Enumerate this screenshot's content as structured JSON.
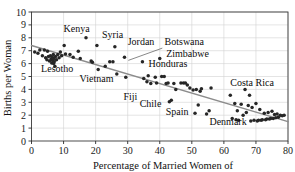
{
  "chart_data": {
    "type": "scatter",
    "title": "",
    "xlabel": "Percentage of Married Women of",
    "ylabel": "Births per Woman",
    "xlim": [
      0,
      80
    ],
    "ylim": [
      0,
      10
    ],
    "xticks": [
      0,
      10,
      20,
      30,
      40,
      50,
      60,
      70,
      80
    ],
    "yticks": [
      0,
      1,
      2,
      3,
      4,
      5,
      6,
      7,
      8,
      9,
      10
    ],
    "grid": true,
    "legend": "none",
    "trendline": {
      "type": "linear",
      "x": [
        0,
        80
      ],
      "y": [
        7.4,
        1.5
      ],
      "color": "#8c8c8c"
    },
    "point_color": "#262626",
    "points": [
      {
        "x": 1.0,
        "y": 6.9
      },
      {
        "x": 2.0,
        "y": 6.8
      },
      {
        "x": 2.6,
        "y": 7.05
      },
      {
        "x": 3.4,
        "y": 6.6
      },
      {
        "x": 4.0,
        "y": 7.05
      },
      {
        "x": 4.4,
        "y": 6.45
      },
      {
        "x": 4.8,
        "y": 6.3
      },
      {
        "x": 5.0,
        "y": 6.95
      },
      {
        "x": 5.3,
        "y": 6.55
      },
      {
        "x": 5.6,
        "y": 6.2
      },
      {
        "x": 5.9,
        "y": 6.6
      },
      {
        "x": 6.1,
        "y": 6.35
      },
      {
        "x": 6.3,
        "y": 6.05
      },
      {
        "x": 6.5,
        "y": 6.5
      },
      {
        "x": 6.6,
        "y": 6.25
      },
      {
        "x": 6.8,
        "y": 6.7
      },
      {
        "x": 6.9,
        "y": 6.0
      },
      {
        "x": 7.0,
        "y": 6.4
      },
      {
        "x": 7.1,
        "y": 6.15
      },
      {
        "x": 7.3,
        "y": 5.8
      },
      {
        "x": 7.5,
        "y": 6.55
      },
      {
        "x": 7.8,
        "y": 6.3
      },
      {
        "x": 8.2,
        "y": 6.7
      },
      {
        "x": 8.6,
        "y": 6.45
      },
      {
        "x": 9.0,
        "y": 6.9
      },
      {
        "x": 9.4,
        "y": 6.6
      },
      {
        "x": 10.2,
        "y": 7.4
      },
      {
        "x": 10.6,
        "y": 6.75
      },
      {
        "x": 12.0,
        "y": 6.7
      },
      {
        "x": 13.0,
        "y": 6.5
      },
      {
        "x": 14.6,
        "y": 6.95
      },
      {
        "x": 15.2,
        "y": 6.4
      },
      {
        "x": 17.0,
        "y": 8.0
      },
      {
        "x": 18.6,
        "y": 6.2
      },
      {
        "x": 19.0,
        "y": 6.1
      },
      {
        "x": 20.4,
        "y": 7.4
      },
      {
        "x": 20.8,
        "y": 5.55
      },
      {
        "x": 23.0,
        "y": 5.8
      },
      {
        "x": 24.4,
        "y": 6.15
      },
      {
        "x": 25.4,
        "y": 6.15
      },
      {
        "x": 26.0,
        "y": 7.3
      },
      {
        "x": 26.6,
        "y": 5.2
      },
      {
        "x": 29.0,
        "y": 6.5
      },
      {
        "x": 29.4,
        "y": 4.95
      },
      {
        "x": 34.6,
        "y": 6.15
      },
      {
        "x": 35.0,
        "y": 4.85
      },
      {
        "x": 36.0,
        "y": 4.6
      },
      {
        "x": 36.4,
        "y": 5.05
      },
      {
        "x": 37.2,
        "y": 4.45
      },
      {
        "x": 38.6,
        "y": 4.95
      },
      {
        "x": 39.0,
        "y": 4.5
      },
      {
        "x": 40.0,
        "y": 6.4
      },
      {
        "x": 40.6,
        "y": 5.0
      },
      {
        "x": 41.4,
        "y": 5.0
      },
      {
        "x": 42.0,
        "y": 4.45
      },
      {
        "x": 42.6,
        "y": 4.5
      },
      {
        "x": 43.0,
        "y": 3.05
      },
      {
        "x": 43.6,
        "y": 3.15
      },
      {
        "x": 44.4,
        "y": 4.45
      },
      {
        "x": 45.0,
        "y": 4.0
      },
      {
        "x": 46.6,
        "y": 4.5
      },
      {
        "x": 47.4,
        "y": 4.5
      },
      {
        "x": 48.0,
        "y": 4.5
      },
      {
        "x": 48.6,
        "y": 4.35
      },
      {
        "x": 49.4,
        "y": 4.1
      },
      {
        "x": 50.4,
        "y": 3.95
      },
      {
        "x": 51.0,
        "y": 2.15
      },
      {
        "x": 51.4,
        "y": 4.0
      },
      {
        "x": 52.0,
        "y": 2.8
      },
      {
        "x": 52.6,
        "y": 3.85
      },
      {
        "x": 53.0,
        "y": 4.05
      },
      {
        "x": 54.6,
        "y": 2.1
      },
      {
        "x": 55.4,
        "y": 2.35
      },
      {
        "x": 56.0,
        "y": 4.1
      },
      {
        "x": 62.0,
        "y": 3.55
      },
      {
        "x": 62.6,
        "y": 1.75
      },
      {
        "x": 63.4,
        "y": 2.9
      },
      {
        "x": 63.8,
        "y": 1.65
      },
      {
        "x": 64.2,
        "y": 2.35
      },
      {
        "x": 64.6,
        "y": 1.6
      },
      {
        "x": 65.4,
        "y": 2.85
      },
      {
        "x": 66.0,
        "y": 2.0
      },
      {
        "x": 66.6,
        "y": 4.0
      },
      {
        "x": 67.0,
        "y": 2.2
      },
      {
        "x": 67.6,
        "y": 2.75
      },
      {
        "x": 68.0,
        "y": 3.55
      },
      {
        "x": 68.4,
        "y": 1.55
      },
      {
        "x": 68.8,
        "y": 2.6
      },
      {
        "x": 69.4,
        "y": 1.6
      },
      {
        "x": 70.0,
        "y": 2.9
      },
      {
        "x": 70.4,
        "y": 1.55
      },
      {
        "x": 70.8,
        "y": 1.6
      },
      {
        "x": 71.2,
        "y": 2.45
      },
      {
        "x": 71.6,
        "y": 1.6
      },
      {
        "x": 72.0,
        "y": 1.65
      },
      {
        "x": 72.6,
        "y": 2.15
      },
      {
        "x": 73.0,
        "y": 1.65
      },
      {
        "x": 73.4,
        "y": 1.7
      },
      {
        "x": 73.8,
        "y": 2.2
      },
      {
        "x": 74.2,
        "y": 1.7
      },
      {
        "x": 74.6,
        "y": 1.75
      },
      {
        "x": 75.0,
        "y": 2.3
      },
      {
        "x": 75.4,
        "y": 1.75
      },
      {
        "x": 75.8,
        "y": 2.05
      },
      {
        "x": 76.2,
        "y": 1.8
      },
      {
        "x": 76.6,
        "y": 2.1
      },
      {
        "x": 77.0,
        "y": 1.85
      },
      {
        "x": 77.6,
        "y": 2.0
      },
      {
        "x": 78.2,
        "y": 1.95
      },
      {
        "x": 78.8,
        "y": 2.0
      }
    ],
    "annotations": [
      {
        "label": "Kenya",
        "x": 10.0,
        "y": 8.45,
        "anchor": "start",
        "leader": null
      },
      {
        "label": "Syria",
        "x": 22.0,
        "y": 7.95,
        "anchor": "start",
        "leader": null
      },
      {
        "label": "Jordan",
        "x": 30.0,
        "y": 7.45,
        "anchor": "start",
        "leader": null
      },
      {
        "label": "Botswana",
        "x": 41.5,
        "y": 7.45,
        "anchor": "start",
        "leader": {
          "x1": 40.8,
          "y1": 7.2,
          "x2": 30.2,
          "y2": 6.25
        }
      },
      {
        "label": "Zimbabwe",
        "x": 42.0,
        "y": 6.55,
        "anchor": "start",
        "leader": null
      },
      {
        "label": "Honduras",
        "x": 36.5,
        "y": 5.75,
        "anchor": "start",
        "leader": null
      },
      {
        "label": "Lesotho",
        "x": 3.0,
        "y": 5.35,
        "anchor": "start",
        "leader": null
      },
      {
        "label": "Vietnam",
        "x": 15.0,
        "y": 4.55,
        "anchor": "start",
        "leader": null
      },
      {
        "label": "Costa Rica",
        "x": 62.0,
        "y": 4.25,
        "anchor": "start",
        "leader": null
      },
      {
        "label": "Fiji",
        "x": 33.0,
        "y": 3.15,
        "anchor": "end",
        "leader": null
      },
      {
        "label": "Chile",
        "x": 40.5,
        "y": 2.65,
        "anchor": "end",
        "leader": null
      },
      {
        "label": "Spain",
        "x": 49.0,
        "y": 2.05,
        "anchor": "end",
        "leader": null
      },
      {
        "label": "Denmark",
        "x": 55.5,
        "y": 1.25,
        "anchor": "start",
        "leader": null
      }
    ]
  }
}
